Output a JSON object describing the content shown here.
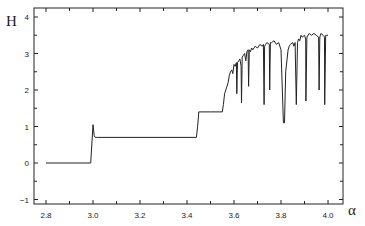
{
  "chart_data": {
    "type": "line",
    "title": "",
    "xlabel": "α",
    "ylabel": "H",
    "xlim": [
      2.75,
      4.06
    ],
    "ylim": [
      -1.25,
      4.3
    ],
    "grid": false,
    "legend": null,
    "x_ticks": [
      2.8,
      3.0,
      3.2,
      3.4,
      3.6,
      3.8,
      4.0
    ],
    "x_tick_labels": [
      "2.8",
      "3.0",
      "3.2",
      "3.4",
      "3.6",
      "3.8",
      "4.0"
    ],
    "x_minor_ticks": [
      2.9,
      3.1,
      3.3,
      3.5,
      3.7,
      3.9
    ],
    "y_ticks": [
      -1,
      0,
      1,
      2,
      3,
      4
    ],
    "y_tick_labels": [
      "−1",
      "0",
      "1",
      "2",
      "3",
      "4"
    ],
    "y_minor_ticks": [
      -0.5,
      0.5,
      1.5,
      2.5,
      3.5
    ],
    "series": [
      {
        "name": "H(α)",
        "x": [
          2.8,
          2.99,
          3.0,
          3.005,
          3.01,
          3.02,
          3.44,
          3.445,
          3.45,
          3.5,
          3.55,
          3.555,
          3.56,
          3.565,
          3.57,
          3.575,
          3.58,
          3.585,
          3.59,
          3.595,
          3.6,
          3.605,
          3.61,
          3.612,
          3.615,
          3.62,
          3.625,
          3.63,
          3.632,
          3.635,
          3.64,
          3.645,
          3.65,
          3.655,
          3.66,
          3.662,
          3.665,
          3.67,
          3.675,
          3.68,
          3.69,
          3.7,
          3.71,
          3.72,
          3.725,
          3.728,
          3.73,
          3.735,
          3.74,
          3.75,
          3.752,
          3.755,
          3.76,
          3.77,
          3.78,
          3.79,
          3.8,
          3.81,
          3.815,
          3.82,
          3.83,
          3.835,
          3.84,
          3.85,
          3.855,
          3.86,
          3.865,
          3.87,
          3.875,
          3.88,
          3.885,
          3.89,
          3.9,
          3.905,
          3.906,
          3.91,
          3.92,
          3.93,
          3.94,
          3.95,
          3.96,
          3.962,
          3.965,
          3.97,
          3.98,
          3.985,
          3.986,
          3.99,
          4.0
        ],
        "y": [
          0.0,
          0.0,
          1.05,
          0.75,
          0.7,
          0.7,
          0.7,
          1.0,
          1.4,
          1.4,
          1.4,
          1.6,
          1.9,
          2.0,
          2.1,
          2.2,
          2.4,
          2.5,
          2.55,
          2.45,
          2.7,
          2.65,
          2.75,
          1.9,
          2.75,
          2.8,
          2.85,
          2.65,
          1.65,
          2.9,
          2.95,
          3.0,
          2.8,
          3.05,
          3.1,
          2.1,
          3.1,
          3.05,
          3.15,
          3.1,
          3.2,
          3.15,
          3.25,
          3.2,
          3.25,
          1.6,
          3.2,
          3.25,
          3.3,
          3.25,
          2.0,
          3.3,
          3.3,
          3.35,
          3.25,
          3.3,
          3.1,
          1.1,
          1.1,
          2.5,
          3.1,
          3.2,
          3.25,
          3.3,
          3.2,
          3.3,
          1.6,
          3.3,
          3.4,
          3.35,
          3.5,
          3.45,
          3.5,
          3.4,
          1.7,
          3.45,
          3.55,
          3.5,
          3.55,
          3.5,
          3.45,
          2.0,
          3.45,
          3.55,
          3.5,
          3.45,
          1.6,
          3.5,
          3.5
        ]
      }
    ]
  },
  "layout": {
    "plot_left": 34,
    "plot_right": 343,
    "plot_top": 8,
    "plot_bottom": 204,
    "x0_value": 2.8,
    "x0_px": 46,
    "px_per_x": 235,
    "y0_px": 163,
    "px_per_y": 36.5
  }
}
